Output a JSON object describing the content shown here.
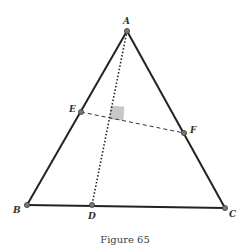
{
  "figure": {
    "caption": "Figure 65",
    "points": {
      "A": {
        "label": "A",
        "x": 127,
        "y": 31
      },
      "B": {
        "label": "B",
        "x": 27,
        "y": 205
      },
      "C": {
        "label": "C",
        "x": 225,
        "y": 208
      },
      "D": {
        "label": "D",
        "x": 92,
        "y": 205
      },
      "E": {
        "label": "E",
        "x": 81,
        "y": 112
      },
      "F": {
        "label": "F",
        "x": 184,
        "y": 133
      }
    },
    "segments": [
      {
        "from": "A",
        "to": "B",
        "style": "solid"
      },
      {
        "from": "A",
        "to": "C",
        "style": "solid"
      },
      {
        "from": "B",
        "to": "C",
        "style": "solid"
      },
      {
        "from": "A",
        "to": "D",
        "style": "dotted"
      },
      {
        "from": "E",
        "to": "F",
        "style": "dashed"
      }
    ],
    "right_angle_marker": {
      "at": "intersection of AD and EF"
    },
    "colors": {
      "line": "#222222",
      "point": "#777777",
      "marker": "#c8c8c8"
    }
  }
}
